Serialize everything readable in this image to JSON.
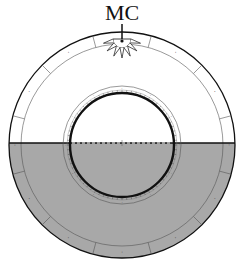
{
  "diagram": {
    "axis_label": "MC",
    "colors": {
      "below_horizon": "#a8a8a8",
      "above_horizon": "#ffffff",
      "line": "#111111",
      "thin_line": "#555555"
    },
    "outer_ring_sectors": 12,
    "outer_ring_labels": [
      "·",
      "·",
      "·",
      "·",
      "·",
      "·",
      "·",
      "·",
      "·",
      "·",
      "·",
      "·"
    ],
    "inner_ring_labels": [
      "·",
      "·",
      "·",
      "·",
      "·",
      "·",
      "·",
      "·",
      "·",
      "·",
      "·",
      "·"
    ],
    "horizon_style": "dashed-inside",
    "sun_marker": "sun-icon"
  }
}
